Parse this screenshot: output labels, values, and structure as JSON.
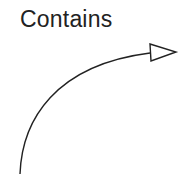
{
  "diagram": {
    "label": "Contains",
    "arrow": {
      "type": "curved-arrow",
      "head": "open-triangle",
      "stroke_color": "#222222",
      "fill_color": "#ffffff"
    }
  }
}
